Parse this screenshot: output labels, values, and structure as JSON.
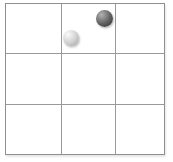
{
  "scene": {
    "description": "3x3 square grid diagram with two marbles located in the top-middle cell",
    "background_color": "#ffffff"
  },
  "board": {
    "rows": 3,
    "cols": 3,
    "rect": {
      "x": 5,
      "y": 3,
      "width": 160,
      "height": 152
    },
    "column_lines_x": [
      61,
      115
    ],
    "row_lines_y": [
      53,
      104
    ],
    "line_color": "#9a9a9a",
    "border_color": "#8f8f8f",
    "cell_background": "#ffffff"
  },
  "balls": [
    {
      "name": "dark-marble",
      "cell": {
        "row": 0,
        "col": 1,
        "position_in_cell": "top-right"
      },
      "cx": 104,
      "cy": 18.5,
      "r": 8.5,
      "highlight_color": "#b2b2b2",
      "mid_color": "#5f5f5f",
      "edge_color": "#2e2e2e"
    },
    {
      "name": "light-marble",
      "cell": {
        "row": 0,
        "col": 1,
        "position_in_cell": "bottom-left"
      },
      "cx": 71,
      "cy": 38,
      "r": 8.3,
      "highlight_color": "#fafafa",
      "mid_color": "#cfcfcf",
      "edge_color": "#9b9b9b"
    }
  ]
}
